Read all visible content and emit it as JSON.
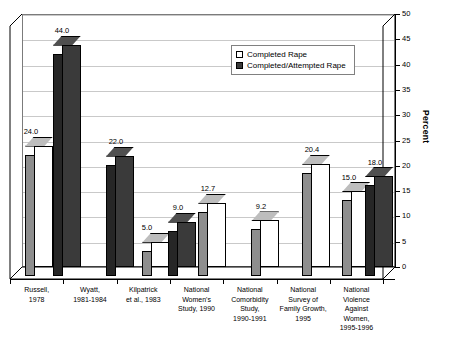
{
  "chart_data": {
    "type": "bar",
    "title": "",
    "subtitle": "",
    "xlabel": "",
    "ylabel": "Percent",
    "ylim": [
      0,
      50
    ],
    "ytick_step": 5,
    "yticks": [
      "0",
      "5",
      "10",
      "15",
      "20",
      "25",
      "30",
      "35",
      "40",
      "45",
      "50"
    ],
    "grid": true,
    "grid_axis": "y",
    "legend_position": "top-center-right",
    "style": "3d-column",
    "categories": [
      "Russell,\n1978",
      "Wyatt,\n1981-1984",
      "Kilpatrick\net al., 1983",
      "National\nWomen's\nStudy, 1990",
      "National\nComorbidity\nStudy,\n1990-1991",
      "National\nSurvey of\nFamily Growth,\n1995",
      "National\nViolence\nAgainst\nWomen,\n1995-1996"
    ],
    "series": [
      {
        "name": "Completed Rape",
        "color": "#ffffff",
        "values": [
          24.0,
          null,
          5.0,
          12.7,
          9.2,
          20.4,
          15.0
        ],
        "labels": [
          "24.0",
          "",
          "5.0",
          "12.7",
          "9.2",
          "20.4",
          "15.0"
        ]
      },
      {
        "name": "Completed/Attempted Rape",
        "color": "#3a3a3a",
        "values": [
          44.0,
          22.0,
          9.0,
          null,
          null,
          null,
          18.0
        ],
        "labels": [
          "44.0",
          "22.0",
          "9.0",
          "",
          "",
          "",
          "18.0"
        ]
      }
    ]
  },
  "legend": {
    "items": [
      {
        "label": "Completed Rape",
        "swatch": "light"
      },
      {
        "label": "Completed/Attempted Rape",
        "swatch": "dark"
      }
    ]
  },
  "axis": {
    "y_title": "Percent"
  }
}
